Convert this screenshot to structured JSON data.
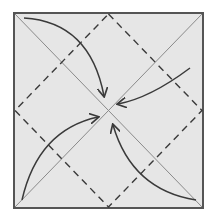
{
  "diagram": {
    "type": "origami-fold-diagram",
    "colors": {
      "paper": "#e6e6e6",
      "border": "#555555",
      "diagonal": "#808080",
      "dashed": "#3a3a3a",
      "arrow": "#3a3a3a",
      "background": "#ffffff"
    },
    "square": {
      "x": 14,
      "y": 13,
      "size": 190
    },
    "arrows": [
      {
        "name": "arrow-top-left-to-center",
        "from": "top-left corner",
        "to": "center"
      },
      {
        "name": "arrow-top-right-to-center",
        "from": "right-middle",
        "to": "center"
      },
      {
        "name": "arrow-bottom-left-to-center",
        "from": "bottom-left corner",
        "to": "center"
      },
      {
        "name": "arrow-bottom-right-to-center",
        "from": "bottom-right corner",
        "to": "center"
      }
    ]
  }
}
